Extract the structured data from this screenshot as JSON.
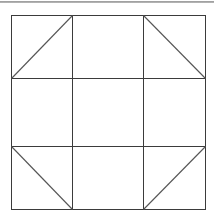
{
  "page": {
    "background_color": "#ffffff",
    "width": 214,
    "height": 220
  },
  "top_rule": {
    "name": "horizontal-divider",
    "color": "#8e8e8e",
    "y": 1,
    "thickness": 2
  },
  "figure": {
    "title": "",
    "caption": "",
    "stroke_color": "#3b3b3b",
    "diagonal_color": "#555555",
    "fill_color": "none",
    "stroke_width": 1
  },
  "geometry": {
    "outer_square": {
      "name": "outer-square",
      "left": 11,
      "top": 15,
      "right": 205,
      "bottom": 209,
      "width": 194,
      "height": 194
    },
    "vertical_grid_lines": [
      {
        "name": "vertical-grid-line-1",
        "x": 72,
        "y1": 15,
        "y2": 209
      },
      {
        "name": "vertical-grid-line-2",
        "x": 143,
        "y1": 15,
        "y2": 209
      }
    ],
    "horizontal_grid_lines": [
      {
        "name": "horizontal-grid-line-1",
        "y": 78,
        "x1": 11,
        "x2": 205
      },
      {
        "name": "horizontal-grid-line-2",
        "y": 146,
        "x1": 11,
        "x2": 205
      }
    ],
    "diagonals": [
      {
        "name": "diagonal-top-left",
        "cell": "top-left",
        "direction": "bottom-left-to-top-right",
        "x1": 11,
        "y1": 78,
        "x2": 72,
        "y2": 15
      },
      {
        "name": "diagonal-top-right",
        "cell": "top-right",
        "direction": "top-left-to-bottom-right",
        "x1": 143,
        "y1": 15,
        "x2": 205,
        "y2": 78
      },
      {
        "name": "diagonal-bottom-left",
        "cell": "bottom-left",
        "direction": "top-left-to-bottom-right",
        "x1": 11,
        "y1": 146,
        "x2": 72,
        "y2": 209
      },
      {
        "name": "diagonal-bottom-right",
        "cell": "bottom-right",
        "direction": "bottom-left-to-top-right",
        "x1": 143,
        "y1": 209,
        "x2": 205,
        "y2": 146
      }
    ],
    "empty_cells": [
      "top-middle",
      "middle-left",
      "center",
      "middle-right",
      "bottom-middle"
    ]
  }
}
